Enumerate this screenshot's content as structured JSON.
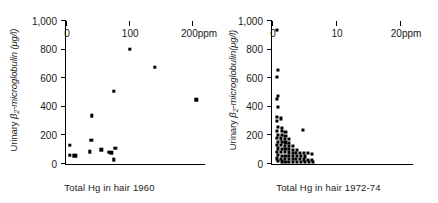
{
  "chart_data": [
    {
      "type": "scatter",
      "title": "",
      "xlabel": "Total Hg in hair 1960",
      "ylabel": "Urinary β2-microglobulin (μg/l)",
      "ylabel_parts": {
        "prefix": "Urinary ",
        "symbol": "β",
        "sub": "2",
        "suffix": "-microglobulin (μg/l)"
      },
      "xunit": "ppm",
      "xlim": [
        0,
        220
      ],
      "ylim": [
        0,
        1000
      ],
      "xticks": [
        0,
        100,
        200
      ],
      "xtick_labels": [
        "0",
        "100",
        "200ppm"
      ],
      "yticks": [
        0,
        200,
        400,
        600,
        800,
        1000
      ],
      "ytick_labels": [
        "0",
        "200",
        "400",
        "600",
        "800",
        "1,000"
      ],
      "grid": false,
      "legend": "none",
      "points": [
        {
          "x": 6,
          "y": 130
        },
        {
          "x": 6,
          "y": 62
        },
        {
          "x": 12,
          "y": 58
        },
        {
          "x": 16,
          "y": 58
        },
        {
          "x": 38,
          "y": 85
        },
        {
          "x": 40,
          "y": 168
        },
        {
          "x": 41,
          "y": 338
        },
        {
          "x": 56,
          "y": 100
        },
        {
          "x": 68,
          "y": 82
        },
        {
          "x": 72,
          "y": 78
        },
        {
          "x": 76,
          "y": 30
        },
        {
          "x": 78,
          "y": 112
        },
        {
          "x": 76,
          "y": 508
        },
        {
          "x": 101,
          "y": 805
        },
        {
          "x": 141,
          "y": 678
        },
        {
          "x": 206,
          "y": 450
        }
      ]
    },
    {
      "type": "scatter",
      "title": "",
      "xlabel": "Total Hg in hair 1972-74",
      "ylabel": "Urinary β2-microglobulin(μg/l)",
      "ylabel_parts": {
        "prefix": "Urinary ",
        "symbol": "β",
        "sub": "2",
        "suffix": "-microglobulin(μg/l)"
      },
      "xunit": "ppm",
      "xlim": [
        0,
        22
      ],
      "ylim": [
        0,
        1000
      ],
      "xticks": [
        0,
        10,
        20
      ],
      "xtick_labels": [
        "0",
        "10",
        "20ppm"
      ],
      "yticks": [
        0,
        200,
        400,
        600,
        800,
        1000
      ],
      "ytick_labels": [
        "0",
        "200",
        "400",
        "600",
        "800",
        "1,000"
      ],
      "grid": false,
      "legend": "none",
      "points": [
        {
          "x": 0.8,
          "y": 935
        },
        {
          "x": 0.9,
          "y": 655
        },
        {
          "x": 0.8,
          "y": 610
        },
        {
          "x": 0.9,
          "y": 478
        },
        {
          "x": 0.8,
          "y": 455
        },
        {
          "x": 0.9,
          "y": 400
        },
        {
          "x": 0.8,
          "y": 330
        },
        {
          "x": 1.4,
          "y": 318
        },
        {
          "x": 0.8,
          "y": 300
        },
        {
          "x": 0.9,
          "y": 258
        },
        {
          "x": 1.5,
          "y": 252
        },
        {
          "x": 4.8,
          "y": 240
        },
        {
          "x": 0.8,
          "y": 232
        },
        {
          "x": 1.5,
          "y": 228
        },
        {
          "x": 2.1,
          "y": 225
        },
        {
          "x": 0.9,
          "y": 205
        },
        {
          "x": 1.5,
          "y": 200
        },
        {
          "x": 2.1,
          "y": 198
        },
        {
          "x": 0.8,
          "y": 182
        },
        {
          "x": 1.4,
          "y": 178
        },
        {
          "x": 2.0,
          "y": 175
        },
        {
          "x": 2.6,
          "y": 172
        },
        {
          "x": 0.9,
          "y": 155
        },
        {
          "x": 1.5,
          "y": 152
        },
        {
          "x": 2.1,
          "y": 150
        },
        {
          "x": 2.7,
          "y": 148
        },
        {
          "x": 0.8,
          "y": 132
        },
        {
          "x": 1.4,
          "y": 130
        },
        {
          "x": 2.0,
          "y": 128
        },
        {
          "x": 2.6,
          "y": 126
        },
        {
          "x": 3.2,
          "y": 124
        },
        {
          "x": 0.9,
          "y": 108
        },
        {
          "x": 1.5,
          "y": 106
        },
        {
          "x": 2.1,
          "y": 104
        },
        {
          "x": 2.7,
          "y": 102
        },
        {
          "x": 3.3,
          "y": 100
        },
        {
          "x": 3.9,
          "y": 98
        },
        {
          "x": 0.8,
          "y": 85
        },
        {
          "x": 1.4,
          "y": 84
        },
        {
          "x": 2.0,
          "y": 82
        },
        {
          "x": 2.6,
          "y": 80
        },
        {
          "x": 3.2,
          "y": 79
        },
        {
          "x": 3.8,
          "y": 78
        },
        {
          "x": 4.4,
          "y": 76
        },
        {
          "x": 5.0,
          "y": 75
        },
        {
          "x": 5.6,
          "y": 74
        },
        {
          "x": 6.2,
          "y": 72
        },
        {
          "x": 0.9,
          "y": 60
        },
        {
          "x": 1.5,
          "y": 58
        },
        {
          "x": 2.1,
          "y": 57
        },
        {
          "x": 2.7,
          "y": 56
        },
        {
          "x": 3.3,
          "y": 55
        },
        {
          "x": 3.9,
          "y": 54
        },
        {
          "x": 4.5,
          "y": 53
        },
        {
          "x": 5.1,
          "y": 52
        },
        {
          "x": 0.8,
          "y": 38
        },
        {
          "x": 1.4,
          "y": 37
        },
        {
          "x": 2.0,
          "y": 36
        },
        {
          "x": 2.6,
          "y": 35
        },
        {
          "x": 3.2,
          "y": 34
        },
        {
          "x": 3.8,
          "y": 33
        },
        {
          "x": 4.4,
          "y": 32
        },
        {
          "x": 5.0,
          "y": 31
        },
        {
          "x": 5.6,
          "y": 30
        },
        {
          "x": 6.3,
          "y": 30
        },
        {
          "x": 0.9,
          "y": 18
        },
        {
          "x": 1.5,
          "y": 17
        },
        {
          "x": 2.1,
          "y": 16
        },
        {
          "x": 2.7,
          "y": 16
        },
        {
          "x": 3.3,
          "y": 15
        },
        {
          "x": 3.9,
          "y": 15
        },
        {
          "x": 4.5,
          "y": 14
        },
        {
          "x": 5.1,
          "y": 14
        },
        {
          "x": 5.8,
          "y": 13
        },
        {
          "x": 6.4,
          "y": 13
        }
      ]
    }
  ]
}
